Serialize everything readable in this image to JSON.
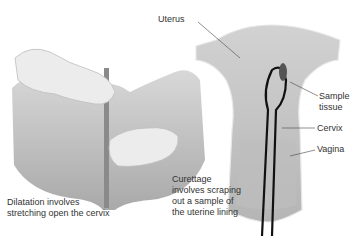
{
  "labels": {
    "uterus": "Uterus",
    "sample_tissue_line1": "Sample",
    "sample_tissue_line2": "tissue",
    "cervix": "Cervix",
    "vagina": "Vagina"
  },
  "captions": {
    "dilatation": [
      "Dilatation involves",
      "stretching open the cervix"
    ],
    "curettage": [
      "Curettage",
      "involves scraping",
      "out a sample of",
      "the uterine lining"
    ]
  },
  "colors": {
    "tissue": "#c9c9c9",
    "tissue_dark": "#9a9a9a",
    "glove": "#e6e6e6",
    "instrument": "#1a1a1a",
    "text": "#333333"
  }
}
